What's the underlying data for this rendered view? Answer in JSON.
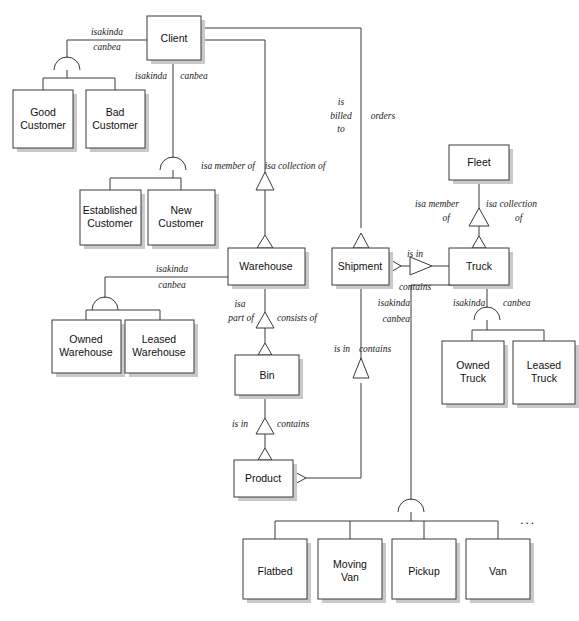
{
  "diagram": {
    "colors": {
      "box_fill": "#ffffff",
      "box_stroke": "#3a3a3a",
      "shadow": "#c9c9c9",
      "text": "#101010"
    },
    "entities": [
      {
        "id": "client",
        "label": "Client",
        "x": 147,
        "y": 16,
        "w": 54,
        "h": 44
      },
      {
        "id": "good-customer",
        "label": "Good Customer",
        "x": 13,
        "y": 90,
        "w": 60,
        "h": 58
      },
      {
        "id": "bad-customer",
        "label": "Bad Customer",
        "x": 86,
        "y": 90,
        "w": 59,
        "h": 58
      },
      {
        "id": "established-customer",
        "label": "Established Customer",
        "x": 80,
        "y": 190,
        "w": 61,
        "h": 55
      },
      {
        "id": "new-customer",
        "label": "New Customer",
        "x": 148,
        "y": 190,
        "w": 67,
        "h": 55
      },
      {
        "id": "warehouse",
        "label": "Warehouse",
        "x": 228,
        "y": 248,
        "w": 77,
        "h": 37
      },
      {
        "id": "owned-warehouse",
        "label": "Owned Warehouse",
        "x": 52,
        "y": 320,
        "w": 69,
        "h": 53
      },
      {
        "id": "leased-warehouse",
        "label": "Leased Warehouse",
        "x": 125,
        "y": 320,
        "w": 69,
        "h": 53
      },
      {
        "id": "bin",
        "label": "Bin",
        "x": 235,
        "y": 355,
        "w": 64,
        "h": 40
      },
      {
        "id": "product",
        "label": "Product",
        "x": 234,
        "y": 460,
        "w": 59,
        "h": 37
      },
      {
        "id": "shipment",
        "label": "Shipment",
        "x": 332,
        "y": 248,
        "w": 57,
        "h": 37
      },
      {
        "id": "fleet",
        "label": "Fleet",
        "x": 449,
        "y": 145,
        "w": 60,
        "h": 35
      },
      {
        "id": "truck",
        "label": "Truck",
        "x": 449,
        "y": 248,
        "w": 60,
        "h": 37
      },
      {
        "id": "owned-truck",
        "label": "Owned Truck",
        "x": 442,
        "y": 341,
        "w": 62,
        "h": 63
      },
      {
        "id": "leased-truck",
        "label": "Leased Truck",
        "x": 513,
        "y": 341,
        "w": 62,
        "h": 63
      },
      {
        "id": "flatbed",
        "label": "Flatbed",
        "x": 243,
        "y": 539,
        "w": 64,
        "h": 60
      },
      {
        "id": "moving-van",
        "label": "Moving Van",
        "x": 318,
        "y": 539,
        "w": 64,
        "h": 60
      },
      {
        "id": "pickup",
        "label": "Pickup",
        "x": 392,
        "y": 539,
        "w": 64,
        "h": 60
      },
      {
        "id": "van",
        "label": "Van",
        "x": 466,
        "y": 539,
        "w": 64,
        "h": 60
      }
    ],
    "relationship_labels": [
      {
        "id": "client-sub1-isakinda",
        "text": "isakinda",
        "x": 107,
        "y": 33,
        "anchor": "middle"
      },
      {
        "id": "client-sub1-canbea",
        "text": "canbea",
        "x": 107,
        "y": 48,
        "anchor": "middle"
      },
      {
        "id": "client-sub2-isakinda",
        "text": "isakinda",
        "x": 151,
        "y": 77,
        "anchor": "middle"
      },
      {
        "id": "client-sub2-canbea",
        "text": "canbea",
        "x": 194,
        "y": 77,
        "anchor": "middle"
      },
      {
        "id": "shipment-is-billed-to-1",
        "text": "is",
        "x": 341,
        "y": 103,
        "anchor": "middle"
      },
      {
        "id": "shipment-is-billed-to-2",
        "text": "billed",
        "x": 341,
        "y": 117,
        "anchor": "middle"
      },
      {
        "id": "shipment-is-billed-to-3",
        "text": "to",
        "x": 341,
        "y": 130,
        "anchor": "middle"
      },
      {
        "id": "shipment-orders",
        "text": "orders",
        "x": 383,
        "y": 117,
        "anchor": "middle"
      },
      {
        "id": "warehouse-isa-member-of",
        "text": "isa member of",
        "x": 228,
        "y": 167,
        "anchor": "middle"
      },
      {
        "id": "warehouse-isa-collection-of",
        "text": "isa collection of",
        "x": 293,
        "y": 167,
        "anchor": "middle"
      },
      {
        "id": "warehouse-sub-isakinda",
        "text": "isakinda",
        "x": 172,
        "y": 270,
        "anchor": "middle"
      },
      {
        "id": "warehouse-sub-canbea",
        "text": "canbea",
        "x": 172,
        "y": 286,
        "anchor": "middle"
      },
      {
        "id": "bin-isa-1",
        "text": "isa",
        "x": 240,
        "y": 305,
        "anchor": "middle"
      },
      {
        "id": "bin-isa-2",
        "text": "part of",
        "x": 241,
        "y": 319,
        "anchor": "middle"
      },
      {
        "id": "bin-consists-of",
        "text": "consists of",
        "x": 277,
        "y": 319,
        "anchor": "start"
      },
      {
        "id": "product-is-in",
        "text": "is in",
        "x": 240,
        "y": 425,
        "anchor": "middle"
      },
      {
        "id": "product-contains",
        "text": "contains",
        "x": 277,
        "y": 425,
        "anchor": "start"
      },
      {
        "id": "shipment-is-in",
        "text": "is in",
        "x": 342,
        "y": 350,
        "anchor": "middle"
      },
      {
        "id": "shipment-contains",
        "text": "contains",
        "x": 372,
        "y": 350,
        "anchor": "middle"
      },
      {
        "id": "truck-is-in",
        "text": "is in",
        "x": 415,
        "y": 255,
        "anchor": "middle"
      },
      {
        "id": "truck-contains",
        "text": "contains",
        "x": 415,
        "y": 287,
        "anchor": "middle"
      },
      {
        "id": "fleet-isa-member-of-1",
        "text": "isa member",
        "x": 455,
        "y": 205,
        "anchor": "end"
      },
      {
        "id": "fleet-isa-member-of-2",
        "text": "of",
        "x": 447,
        "y": 219,
        "anchor": "end"
      },
      {
        "id": "fleet-isa-collection-of-1",
        "text": "isa collection",
        "x": 483,
        "y": 205,
        "anchor": "start"
      },
      {
        "id": "fleet-isa-collection-of-2",
        "text": "of",
        "x": 512,
        "y": 219,
        "anchor": "start"
      },
      {
        "id": "vehicle-isakinda",
        "text": "isakinda",
        "x": 412,
        "y": 304,
        "anchor": "end"
      },
      {
        "id": "vehicle-canbea",
        "text": "canbea",
        "x": 412,
        "y": 320,
        "anchor": "end"
      },
      {
        "id": "truck-sub-isakinda",
        "text": "isakinda",
        "x": 454,
        "y": 304,
        "anchor": "start"
      },
      {
        "id": "truck-sub-canbea",
        "text": "canbea",
        "x": 503,
        "y": 304,
        "anchor": "start"
      },
      {
        "id": "vehicle-more",
        "text": "...",
        "x": 528,
        "y": 521,
        "anchor": "middle"
      }
    ],
    "legend": {
      "generalization_symbol": "open triangle",
      "aggregation_symbol": "arc over subtype fan",
      "ellipsis": "..."
    }
  }
}
